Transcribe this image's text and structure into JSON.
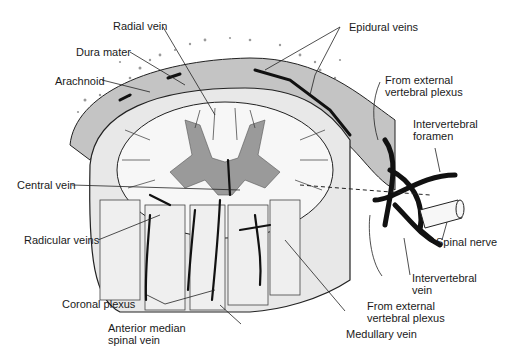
{
  "diagram": {
    "type": "anatomical-illustration",
    "colors": {
      "background": "#ffffff",
      "ink": "#1a1a1a",
      "gray_matter": "#9a9a9a",
      "dura_fill": "#bdbdbd",
      "white_matter": "#f7f7f7",
      "vein": "#111111"
    },
    "labels": {
      "radial_vein": "Radial vein",
      "dura_mater": "Dura mater",
      "arachnoid": "Arachnoid",
      "epidural_veins": "Epidural veins",
      "from_external_top_1": "From external",
      "from_external_top_2": "vertebral plexus",
      "intervertebral_foramen_1": "Intervertebral",
      "intervertebral_foramen_2": "foramen",
      "central_vein": "Central vein",
      "radicular_veins": "Radicular veins",
      "spinal_nerve": "Spinal nerve",
      "intervertebral_vein_1": "Intervertebral",
      "intervertebral_vein_2": "vein",
      "from_external_bottom_1": "From external",
      "from_external_bottom_2": "vertebral plexus",
      "coronal_plexus": "Coronal plexus",
      "anterior_median_1": "Anterior median",
      "anterior_median_2": "spinal vein",
      "medullary_vein": "Medullary vein"
    }
  }
}
